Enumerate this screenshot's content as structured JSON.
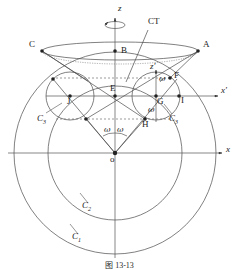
{
  "figure": {
    "type": "geometric-diagram",
    "caption": "图 13-13",
    "axes": [
      {
        "name": "z",
        "label": "z",
        "x": 118,
        "y": 8,
        "italic": true
      },
      {
        "name": "x",
        "label": "x",
        "x": 226,
        "y": 148,
        "italic": true
      },
      {
        "name": "x-prime",
        "label": "x′",
        "x": 223,
        "y": 93,
        "italic": true
      },
      {
        "name": "z-prime",
        "label": "z′",
        "x": 151,
        "y": 68,
        "italic": true
      }
    ],
    "points": [
      {
        "name": "A",
        "label": "A",
        "x": 203,
        "y": 44
      },
      {
        "name": "B",
        "label": "B",
        "x": 122,
        "y": 50
      },
      {
        "name": "C",
        "label": "C",
        "x": 30,
        "y": 44
      },
      {
        "name": "E",
        "label": "E",
        "x": 118,
        "y": 90
      },
      {
        "name": "F",
        "label": "F",
        "x": 172,
        "y": 76
      },
      {
        "name": "G",
        "label": "G",
        "x": 155,
        "y": 101
      },
      {
        "name": "H",
        "label": "H",
        "x": 143,
        "y": 119
      },
      {
        "name": "I",
        "label": "I",
        "x": 173,
        "y": 100
      },
      {
        "name": "J",
        "label": "J",
        "x": 70,
        "y": 98
      },
      {
        "name": "O",
        "label": "o",
        "x": 110,
        "y": 158
      }
    ],
    "curve_labels": [
      {
        "name": "C1",
        "base": "C",
        "sub": "1",
        "x": 72,
        "y": 236
      },
      {
        "name": "C2",
        "base": "C",
        "sub": "2",
        "x": 82,
        "y": 205
      },
      {
        "name": "C3-left",
        "base": "C",
        "sub": "3",
        "x": 38,
        "y": 118
      },
      {
        "name": "C3-right",
        "base": "C",
        "sub": "3",
        "x": 170,
        "y": 118
      }
    ],
    "angle_labels": [
      {
        "name": "omega-left",
        "label": "ω",
        "x": 106,
        "y": 128
      },
      {
        "name": "omega-right",
        "label": "ω",
        "x": 118,
        "y": 128
      },
      {
        "name": "omega-upper-right",
        "label": "ω",
        "x": 160,
        "y": 79
      },
      {
        "name": "omega-lower-right",
        "label": "ω",
        "x": 150,
        "y": 110
      }
    ],
    "annotations": [
      {
        "name": "CT",
        "label": "CT",
        "x": 150,
        "y": 22
      }
    ],
    "colors": {
      "stroke": "#3a3a3a",
      "stroke_light": "#6e6e6e",
      "point_fill": "#222222",
      "background": "#ffffff",
      "text": "#1a1a1a"
    },
    "geometry": {
      "origin": {
        "x": 115,
        "y": 153
      },
      "x_axis_y": 153,
      "x_prime_axis_y": 96,
      "z_axis_x": 115,
      "circle_c1_radius": 101,
      "circle_c2_radius": 67,
      "circle_c3_radius": 24,
      "circle_c3_left_center": {
        "x": 70,
        "y": 96
      },
      "circle_c3_right_center": {
        "x": 156,
        "y": 96
      },
      "top_ellipse_center": {
        "x": 120,
        "y": 51
      },
      "top_ellipse_rx": 78,
      "top_ellipse_ry": 9
    }
  }
}
